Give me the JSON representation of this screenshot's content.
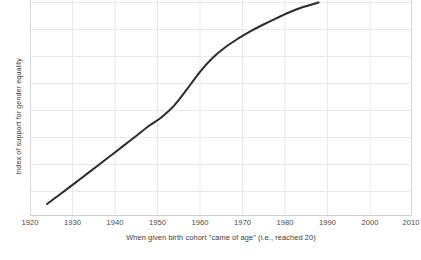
{
  "chart_data": {
    "type": "line",
    "title": "",
    "xlabel": "When given birth cohort \"came of age\" (i.e., reached 20)",
    "ylabel": "Index of support for gender equality",
    "xlim": [
      1920,
      2010
    ],
    "ylim": [
      0,
      100
    ],
    "xticks": [
      1920,
      1930,
      1940,
      1950,
      1960,
      1970,
      1980,
      1990,
      2000,
      2010
    ],
    "xticklabels": [
      "1920",
      "1930",
      "1940",
      "1950",
      "1960",
      "1970",
      "1980",
      "1990",
      "2000",
      "2010"
    ],
    "yticks": [],
    "yticklabels": [],
    "grid": true,
    "grid_color": "#e9e9e9",
    "legend": null,
    "line_color": "#2b2b2b",
    "line_width": 2.0,
    "series": [
      {
        "name": "Index of support for gender equality",
        "x": [
          1924,
          1928,
          1932,
          1936,
          1940,
          1944,
          1948,
          1951,
          1954,
          1957,
          1960,
          1963,
          1966,
          1969,
          1972,
          1975,
          1978,
          1981,
          1984,
          1988
        ],
        "values": [
          5.1,
          11.0,
          17.0,
          23.0,
          29.1,
          35.2,
          41.4,
          45.5,
          51.0,
          58.5,
          66.5,
          73.0,
          78.0,
          82.0,
          85.5,
          88.6,
          91.5,
          94.2,
          96.5,
          98.8
        ]
      }
    ],
    "annotations": []
  },
  "figure": {
    "background": "#ffffff",
    "plot_area": {
      "left": 30,
      "top": 0,
      "right": 412,
      "bottom": 215
    },
    "axis_color": "#d8d8d8",
    "tick_text_color": "#4a4a4a"
  }
}
